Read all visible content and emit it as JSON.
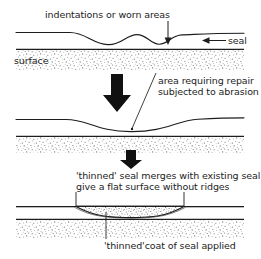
{
  "figure": {
    "background": "#ffffff",
    "line_color": "#1d1d1d",
    "stipple_color": "#6e6e6e",
    "arrow_color": "#111111"
  },
  "labels": {
    "indentations": "indentations or worn areas",
    "seal": "seal",
    "surface": "surface",
    "area_line1": "area requiring repair",
    "area_line2": "subjected to abrasion",
    "merge_line1": "'thinned' seal merges with existing seal to",
    "merge_line2": "give a flat surface without ridges",
    "coat": "'thinned'coat of seal applied"
  },
  "panels": [
    {
      "name": "panel-worn-seal",
      "description": "Seal layer over stippled surface showing one wide shallow indentation and two narrow worn dips",
      "seal_top_y": 32,
      "surface_band": {
        "top": 48,
        "bottom": 70
      },
      "callouts": [
        "indentations",
        "seal",
        "surface"
      ]
    },
    {
      "name": "panel-area-requiring-repair",
      "description": "Seal layer with a single broad shallow depression, leader line to annotation",
      "seal_top_y": 118,
      "surface_band": {
        "top": 135,
        "bottom": 152
      },
      "callouts": [
        "area_line1",
        "area_line2"
      ]
    },
    {
      "name": "panel-thinned-coat-applied",
      "description": "Depression filled with a stippled thinned coat of seal giving a flat surface",
      "seal_top_y": 205,
      "surface_band": {
        "top": 218,
        "bottom": 238
      },
      "callouts": [
        "merge_line1",
        "merge_line2",
        "coat"
      ]
    }
  ],
  "flow_arrows": [
    {
      "name": "arrow-step-1-to-2",
      "direction": "down",
      "x": 117,
      "y_top": 72,
      "y_bottom": 112
    },
    {
      "name": "arrow-step-2-to-3",
      "direction": "down",
      "x": 131,
      "y_top": 150,
      "y_bottom": 168
    }
  ],
  "pointer_arrows": [
    {
      "name": "pointer-indentations",
      "direction": "down",
      "from": [
        168,
        22
      ],
      "to": [
        168,
        42
      ]
    },
    {
      "name": "pointer-seal",
      "direction": "left",
      "from": [
        226,
        41
      ],
      "to": [
        203,
        41
      ]
    }
  ],
  "leader_lines": [
    {
      "name": "leader-area-requiring-repair",
      "from": [
        156,
        74
      ],
      "to": [
        131,
        128
      ]
    },
    {
      "name": "leader-thinned-coat",
      "from": [
        106,
        238
      ],
      "to": [
        106,
        213
      ]
    }
  ],
  "brackets": [
    {
      "name": "bracket-merged-seal",
      "left": 76,
      "right": 184,
      "top": 192,
      "bottom": 206
    }
  ]
}
